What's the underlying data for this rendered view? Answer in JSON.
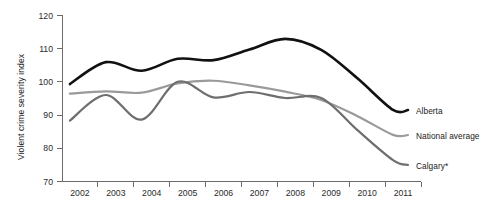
{
  "chart_data": {
    "type": "line",
    "title": "",
    "subtitle": "",
    "xlabel": "",
    "ylabel": "Violent crime severity index",
    "x": [
      2002,
      2003,
      2004,
      2005,
      2006,
      2007,
      2008,
      2009,
      2010,
      2011
    ],
    "xtick_labels": [
      "2002",
      "2003",
      "2004",
      "2005",
      "2006",
      "2007",
      "2008",
      "2009",
      "2010",
      "2011"
    ],
    "ytick_labels": [
      "70",
      "80",
      "90",
      "100",
      "110",
      "120"
    ],
    "ytick_values": [
      70,
      80,
      90,
      100,
      110,
      120
    ],
    "ylim": [
      70,
      120
    ],
    "grid": false,
    "legend_position": "right-inline",
    "series": [
      {
        "name": "Alberta",
        "color": "#111111",
        "width": 2.6,
        "values": [
          99.2,
          105.8,
          103.2,
          106.8,
          106.4,
          109.6,
          112.8,
          109.5,
          101.0,
          91.4
        ]
      },
      {
        "name": "National average",
        "color": "#9a9a9a",
        "width": 2.2,
        "values": [
          96.3,
          97.0,
          96.6,
          99.4,
          100.2,
          98.8,
          96.9,
          94.4,
          89.6,
          83.9
        ]
      },
      {
        "name": "Calgary*",
        "color": "#6e6e6e",
        "width": 2.2,
        "values": [
          88.2,
          95.9,
          88.5,
          99.9,
          95.2,
          96.8,
          95.0,
          95.0,
          85.4,
          76.3
        ]
      }
    ]
  },
  "geometry": {
    "plot_left": 62,
    "plot_right": 421,
    "plot_bottom": 181,
    "plot_top": 15,
    "label_x": 408,
    "series_label_x": 416,
    "series_label_y": [
      112,
      137,
      167
    ]
  }
}
